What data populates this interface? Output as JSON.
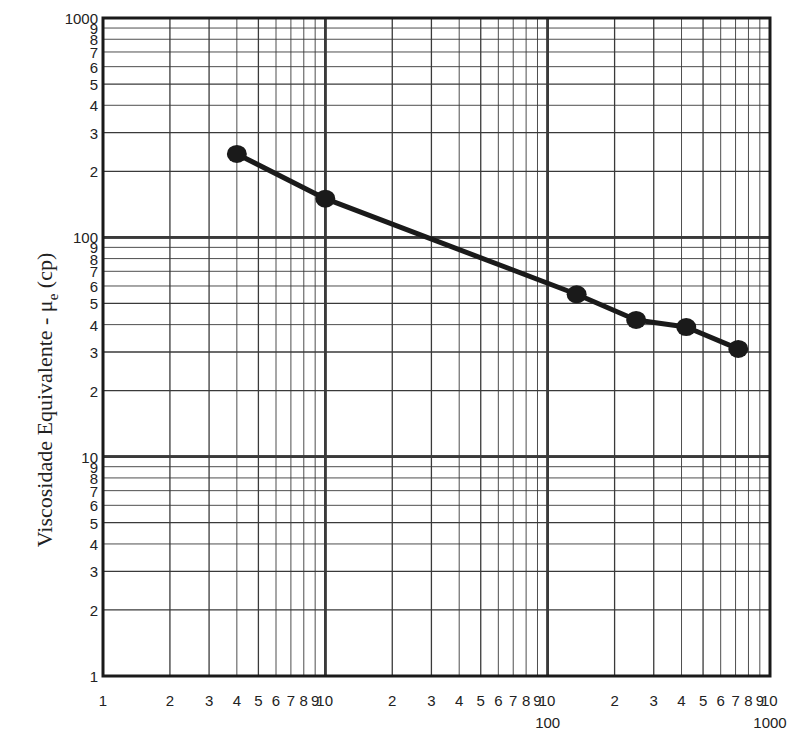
{
  "chart_data": {
    "type": "line",
    "title": "",
    "xlabel": "",
    "ylabel": "Viscosidade Equivalente - μe (cp)",
    "ylabel_parts": {
      "main": "Viscosidade Equivalente - μ",
      "sub": "e",
      "unit": " (cp)"
    },
    "x_scale": "log",
    "y_scale": "log",
    "xlim": [
      1,
      1000
    ],
    "ylim": [
      1,
      1000
    ],
    "grid": true,
    "x_tick_labels": [
      "1",
      "2",
      "3",
      "4",
      "5",
      "6",
      "7",
      "8",
      "9",
      "10",
      "2",
      "3",
      "4",
      "5",
      "6",
      "7",
      "8",
      "9",
      "10",
      "2",
      "3",
      "4",
      "5",
      "6",
      "7",
      "8",
      "9",
      "10"
    ],
    "x_decade_labels": [
      "100",
      "1000"
    ],
    "y_tick_labels": [
      "1",
      "2",
      "3",
      "4",
      "5",
      "6",
      "7",
      "8",
      "9",
      "10",
      "2",
      "3",
      "4",
      "5",
      "6",
      "7",
      "8",
      "9",
      "100",
      "2",
      "3",
      "4",
      "5",
      "6",
      "7",
      "8",
      "9",
      "1000"
    ],
    "series": [
      {
        "name": "Viscosidade Equivalente",
        "marker": "circle",
        "line": true,
        "x": [
          4,
          10,
          135,
          250,
          420,
          720
        ],
        "y": [
          240,
          150,
          55,
          42,
          39,
          31
        ]
      }
    ]
  },
  "colors": {
    "ink": "#1a1a1a",
    "grid": "#3a3a3a",
    "background": "#ffffff"
  }
}
